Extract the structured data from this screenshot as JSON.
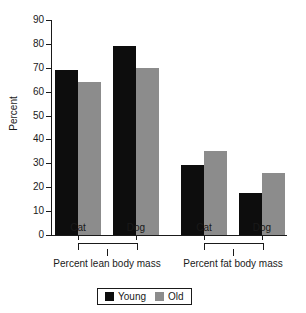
{
  "chart_data": {
    "type": "bar",
    "title": "",
    "xlabel": "",
    "ylabel": "Percent",
    "ylim": [
      0,
      90
    ],
    "ytick_values": [
      0,
      10,
      20,
      30,
      40,
      50,
      60,
      70,
      80,
      90
    ],
    "ytick_labels": [
      "0",
      "10",
      "20",
      "30",
      "40",
      "50",
      "60",
      "70",
      "80",
      "90"
    ],
    "grid": false,
    "legend_position": "bottom-center",
    "categories": [
      "Cat",
      "Dog",
      "Cat",
      "Dog"
    ],
    "groups": [
      {
        "label": "Percent lean body mass",
        "categories": [
          "Cat",
          "Dog"
        ]
      },
      {
        "label": "Percent fat body mass",
        "categories": [
          "Cat",
          "Dog"
        ]
      }
    ],
    "series": [
      {
        "name": "Young",
        "color": "#0d0d0d",
        "values": [
          69,
          79,
          29.5,
          17.5
        ]
      },
      {
        "name": "Old",
        "color": "#8c8c8c",
        "values": [
          64,
          70,
          35,
          26
        ]
      }
    ],
    "legend": [
      "Young",
      "Old"
    ]
  },
  "legend": {
    "young_label": "Young",
    "old_label": "Old"
  },
  "axis": {
    "y_title": "Percent"
  }
}
